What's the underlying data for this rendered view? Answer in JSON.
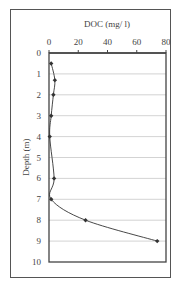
{
  "chart_data": {
    "type": "line",
    "title": "",
    "xlabel": "DOC (mg/ l)",
    "ylabel": "Depth (m)",
    "x_axis_position": "top",
    "y_axis_inverted": true,
    "xlim": [
      0,
      80
    ],
    "ylim": [
      0,
      10
    ],
    "x_ticks": [
      "0",
      "20",
      "40",
      "60",
      "80"
    ],
    "y_ticks": [
      "0",
      "1",
      "2",
      "3",
      "4",
      "5",
      "6",
      "7",
      "8",
      "9",
      "10"
    ],
    "grid": "horizontal",
    "legend": null,
    "smoothed": true,
    "series": [
      {
        "name": "DOC",
        "color": "#333333",
        "marker": "diamond",
        "points": [
          {
            "doc": 1.5,
            "depth": 0.5
          },
          {
            "doc": 4,
            "depth": 1.3
          },
          {
            "doc": 3,
            "depth": 2
          },
          {
            "doc": 1.5,
            "depth": 3
          },
          {
            "doc": 0.5,
            "depth": 4
          },
          {
            "doc": 3.5,
            "depth": 6
          },
          {
            "doc": 1.5,
            "depth": 7
          },
          {
            "doc": 25,
            "depth": 8
          },
          {
            "doc": 74,
            "depth": 9
          }
        ]
      }
    ]
  },
  "colors": {
    "frame": "#555555",
    "axis": "#444444",
    "grid": "#c8c8c8",
    "line": "#333333"
  }
}
